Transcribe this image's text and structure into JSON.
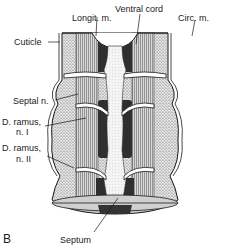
{
  "figure": {
    "panel_letter": "B",
    "labels": {
      "ventral_cord": "Ventral cord",
      "longit_m": "Longit. m.",
      "circ_m": "Circ. m.",
      "cuticle": "Cuticle",
      "septal_n": "Septal n.",
      "d_ramus_1_line1": "D. ramus,",
      "d_ramus_1_line2": "n. I",
      "d_ramus_2_line1": "D. ramus,",
      "d_ramus_2_line2": "n. II",
      "septum": "Septum"
    },
    "colors": {
      "ink": "#1a1a1a",
      "paper": "#ffffff",
      "muscle_dark": "#2a2a2a",
      "muscle_mid": "#8a8a8a",
      "stipple": "#bdbdbd"
    }
  }
}
